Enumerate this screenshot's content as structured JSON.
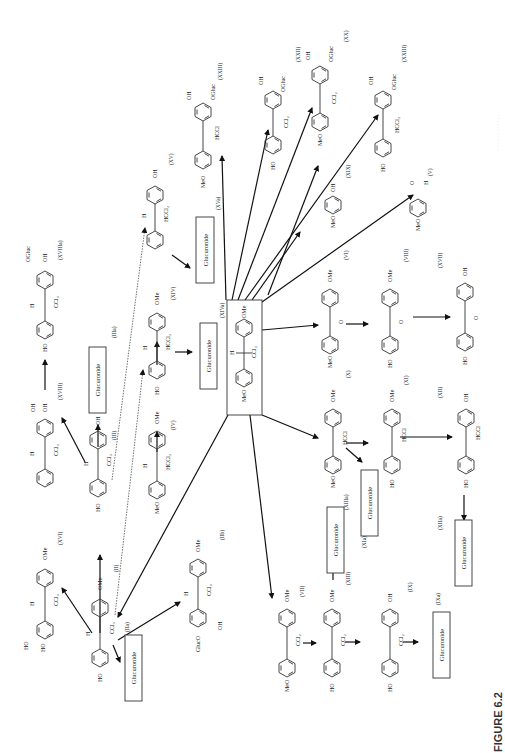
{
  "figure": {
    "caption": "FIGURE 6.2",
    "caption_faint": "Metabolic pathways of methoxychlor ... (Adapted from ...)",
    "orientation": "rotated 90° counter-clockwise (read with page turned)"
  },
  "central": {
    "id": "(XIVa)",
    "substituents": {
      "left": "MeO",
      "right": "OMe",
      "bridge_h": "H",
      "bridge_group": "CCl3"
    }
  },
  "glucuronide_label": "Glucuronide",
  "compounds": [
    {
      "id": "(XXIII)",
      "groups": [
        "MeO",
        "OH",
        "OGluc",
        "HCCl"
      ],
      "note": "top-left product"
    },
    {
      "id": "(XV)",
      "groups": [
        "HO",
        "OH",
        "H",
        "HCCl2"
      ]
    },
    {
      "id": "(XVa)",
      "label": "(XVa)"
    },
    {
      "id": "(XXII)",
      "groups": [
        "HO",
        "OH",
        "OGluc",
        "CCl2"
      ]
    },
    {
      "id": "(XX)",
      "groups": [
        "MeO",
        "OH",
        "OGluc",
        "CCl2"
      ]
    },
    {
      "id": "(XXIII)",
      "groups": [
        "HO",
        "OH",
        "OGluc",
        "HCCl2"
      ],
      "note": "right"
    },
    {
      "id": "(XIX)",
      "groups": [
        "MeO",
        "OH"
      ]
    },
    {
      "id": "(V)",
      "groups": [
        "MeO",
        "O",
        "H"
      ]
    },
    {
      "id": "(VI)",
      "label": "(VI)"
    },
    {
      "id": "(X)",
      "groups": [
        "MeO",
        "OMe",
        "O"
      ]
    },
    {
      "id": "(VIII)",
      "groups": [
        "HO",
        "OMe",
        "O"
      ]
    },
    {
      "id": "(XVII)",
      "groups": [
        "HO",
        "OH",
        "O"
      ],
      "note": "benzophenone"
    },
    {
      "id": "(XI)",
      "groups": [
        "MeO",
        "OMe",
        "HCCl"
      ]
    },
    {
      "id": "(XII)",
      "groups": [
        "HO",
        "OMe",
        "HCCl"
      ]
    },
    {
      "id": "(XIIa)",
      "label": "(XIIa)"
    },
    {
      "id": "(XIIIa)",
      "label": "(XIIIa)"
    },
    {
      "id": "(XIa)",
      "label": "(XIa)"
    },
    {
      "id": "(VII)",
      "groups": [
        "MeO",
        "OMe",
        "CCl2"
      ]
    },
    {
      "id": "(XIII)",
      "groups": [
        "HO",
        "OMe",
        "CCl2"
      ]
    },
    {
      "id": "(IX)",
      "groups": [
        "HO",
        "OH",
        "CCl2"
      ]
    },
    {
      "id": "(IXa)",
      "label": "(IXa)"
    },
    {
      "id": "(XIV)",
      "groups": [
        "HO",
        "OMe",
        "H",
        "HCCl2"
      ]
    },
    {
      "id": "(IV)",
      "groups": [
        "MeO",
        "OMe",
        "H",
        "HCCl2"
      ]
    },
    {
      "id": "(IIIa)",
      "label": "(IIIa)"
    },
    {
      "id": "(III)",
      "groups": [
        "HO",
        "OH",
        "H",
        "CCl3"
      ]
    },
    {
      "id": "(XVIII)",
      "groups": [
        "HO",
        "OH",
        "OH",
        "H",
        "CCl3"
      ]
    },
    {
      "id": "(XVIIIa)",
      "groups": [
        "HO",
        "OH",
        "OGluc",
        "H",
        "CCl3"
      ]
    },
    {
      "id": "(II)",
      "groups": [
        "HO",
        "OMe",
        "H",
        "CCl3"
      ]
    },
    {
      "id": "(IIa)",
      "label": "(IIa)"
    },
    {
      "id": "(XVI)",
      "groups": [
        "HO",
        "HO",
        "OMe",
        "H",
        "CCl3"
      ]
    },
    {
      "id": "(IIb)",
      "groups": [
        "GlucO",
        "OH",
        "OMe",
        "H",
        "CCl3"
      ]
    }
  ],
  "labels": {
    "XXIII_a": "(XXIII)",
    "XV": "(XV)",
    "XVa": "(XVa)",
    "XXII": "(XXII)",
    "XX": "(XX)",
    "XXIII_b": "(XXIII)",
    "XIX": "(XIX)",
    "V": "(V)",
    "VI": "(VI)",
    "X": "(X)",
    "VIII": "(VIII)",
    "XVII": "(XVII)",
    "XI": "(XI)",
    "XII": "(XII)",
    "XIIa": "(XIIa)",
    "XIIIa": "(XIIIa)",
    "XIa": "(XIa)",
    "VII": "(VII)",
    "XIII": "(XIII)",
    "IX": "(IX)",
    "IXa": "(IXa)",
    "XIV": "(XIV)",
    "IV": "(IV)",
    "IIIa": "(IIIa)",
    "III": "(III)",
    "XVIII": "(XVIII)",
    "XVIIIa": "(XVIIIa)",
    "II": "(II)",
    "IIa": "(IIa)",
    "XVI": "(XVI)",
    "IIb": "(IIb)",
    "XIVa": "(XIVa)"
  },
  "groups": {
    "MeO": "MeO",
    "OMe": "OMe",
    "HO": "HO",
    "OH": "OH",
    "H": "H",
    "O": "O",
    "CCl3": "CCl₃",
    "HCCl2": "HCCl₂",
    "CCl2": "CCl₂",
    "HCCl": "HCCl",
    "OGluc": "OGluc",
    "GlucO": "GlucO"
  }
}
